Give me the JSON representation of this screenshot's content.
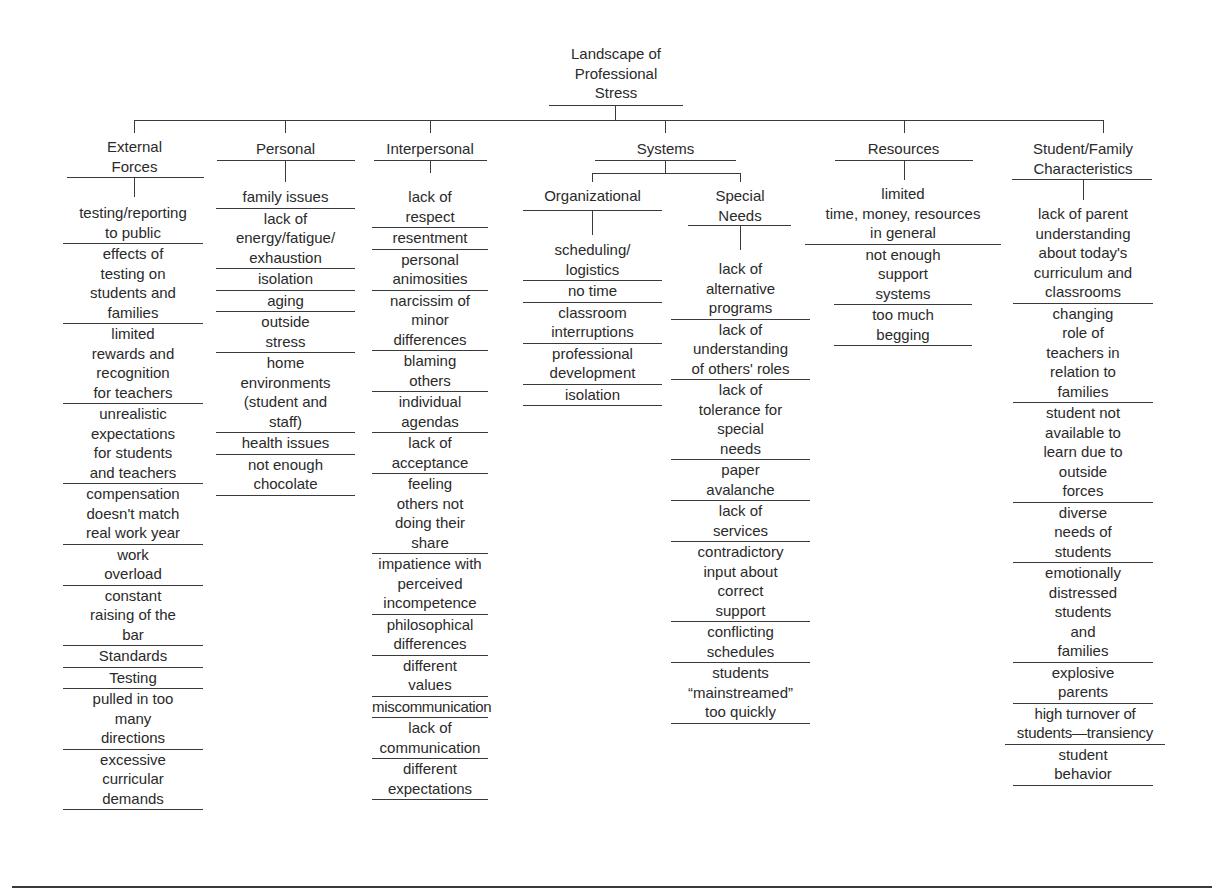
{
  "root": {
    "title": "Landscape of\nProfessional\nStress"
  },
  "categories": {
    "external": {
      "title": "External\nForces",
      "items": [
        "testing/reporting\nto public",
        "effects of\ntesting on\nstudents and\nfamilies",
        "limited\nrewards and\nrecognition\nfor teachers",
        "unrealistic\nexpectations\nfor students\nand teachers",
        "compensation\ndoesn't match\nreal work year",
        "work\noverload",
        "constant\nraising of the\nbar",
        "Standards",
        "Testing",
        "pulled in too\nmany\ndirections",
        "excessive\ncurricular\ndemands"
      ]
    },
    "personal": {
      "title": "Personal",
      "items": [
        "family issues",
        "lack of\nenergy/fatigue/\nexhaustion",
        "isolation",
        "aging",
        "outside\nstress",
        "home\nenvironments\n(student and\nstaff)",
        "health issues",
        "not enough\nchocolate"
      ]
    },
    "interpersonal": {
      "title": "Interpersonal",
      "items": [
        "lack of\nrespect",
        "resentment",
        "personal\nanimosities",
        "narcissim of\nminor\ndifferences",
        "blaming\nothers",
        "individual\nagendas",
        "lack of\nacceptance",
        "feeling\nothers not\ndoing their\nshare",
        "impatience with\nperceived\nincompetence",
        "philosophical\ndifferences",
        "different\nvalues",
        "miscommunication",
        "lack of\ncommunication",
        "different\nexpectations"
      ]
    },
    "systems": {
      "title": "Systems",
      "organizational": {
        "title": "Organizational",
        "items": [
          "scheduling/\nlogistics",
          "no time",
          "classroom\ninterruptions",
          "professional\ndevelopment",
          "isolation"
        ]
      },
      "special_needs": {
        "title": "Special\nNeeds",
        "items": [
          "lack of\nalternative\nprograms",
          "lack of\nunderstanding\nof others' roles",
          "lack of\ntolerance for\nspecial\nneeds",
          "paper\navalanche",
          "lack of\nservices",
          "contradictory\ninput about\ncorrect\nsupport",
          "conflicting\nschedules",
          "students\n“mainstreamed”\ntoo quickly"
        ]
      }
    },
    "resources": {
      "title": "Resources",
      "items": [
        "limited\ntime, money, resources\nin general",
        "not enough\nsupport\nsystems",
        "too much\nbegging"
      ]
    },
    "student_family": {
      "title": "Student/Family\nCharacteristics",
      "items": [
        "lack of parent\nunderstanding\nabout today's\ncurriculum and\nclassrooms",
        "changing\nrole of\nteachers in\nrelation to\nfamilies",
        "student not\navailable to\nlearn due to\noutside\nforces",
        "diverse\nneeds of\nstudents",
        "emotionally\ndistressed\nstudents\nand\nfamilies",
        "explosive\nparents",
        "high turnover of\nstudents—transiency",
        "student\nbehavior"
      ]
    }
  }
}
